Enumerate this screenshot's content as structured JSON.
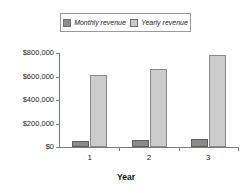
{
  "chart_data": {
    "type": "bar",
    "title": "",
    "categories": [
      "1",
      "2",
      "3"
    ],
    "series": [
      {
        "name": "Monthly revenue",
        "color": "#8a8a8a",
        "values": [
          50000,
          57000,
          70000
        ]
      },
      {
        "name": "Yearly revenue",
        "color": "#cccccc",
        "values": [
          610000,
          660000,
          780000
        ]
      }
    ],
    "xlabel": "Year",
    "ylabel": "",
    "ylim": [
      0,
      800000
    ],
    "yticks": [
      0,
      200000,
      400000,
      600000,
      800000
    ],
    "ytick_labels": [
      "$0",
      "$200,000",
      "$400,000",
      "$600,000",
      "$800,000"
    ],
    "grid": false,
    "legend_position": "top"
  },
  "legend": {
    "entries": [
      {
        "label": "Monthly revenue",
        "swatch": "monthly-swatch"
      },
      {
        "label": "Yearly revenue",
        "swatch": "yearly-swatch"
      }
    ]
  },
  "axes": {
    "x_title": "Year",
    "x_tick_labels": [
      "1",
      "2",
      "3"
    ],
    "y_tick_labels": [
      "$0",
      "$200,000",
      "$400,000",
      "$600,000",
      "$800,000"
    ]
  },
  "colors": {
    "monthly": "#8a8a8a",
    "yearly": "#cccccc",
    "axis": "#7b7b7b",
    "legend_border": "#9a9a9a",
    "background": "#ffffff"
  }
}
